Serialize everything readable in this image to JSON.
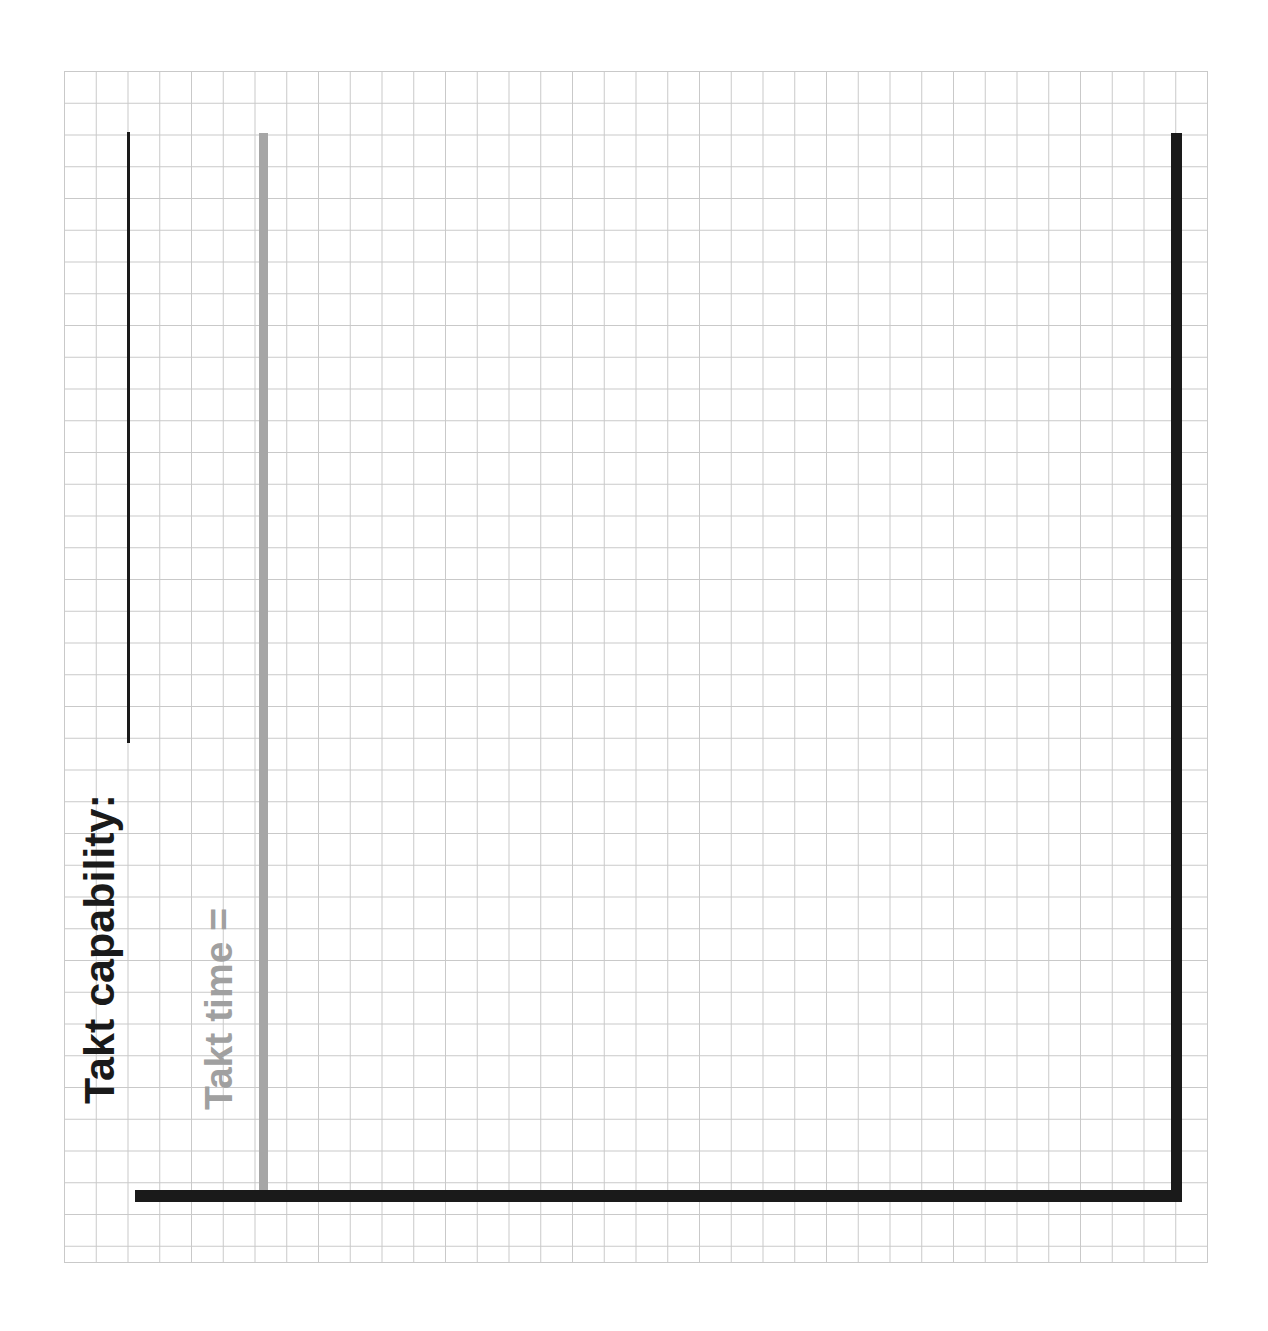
{
  "diagram": {
    "type": "takt-time-vs-capability-sketch",
    "background": "#ffffff",
    "grid": {
      "name": "graph-paper-grid",
      "line_color": "#c9c9c9",
      "cell_size_px": 31.75,
      "visible": true
    },
    "labels": {
      "capability": "Takt capability:",
      "takt_time": "Takt time ="
    },
    "colors": {
      "capability_text": "#1a1a1a",
      "takt_time_text": "#a0a0a0",
      "axis": "#1a1a1a",
      "takt_time_bar": "#a6a6a6",
      "grid_line": "#c9c9c9"
    },
    "marks": [
      {
        "name": "capability-line",
        "color": "#1a1a1a",
        "style": "thin-vertical-rule"
      },
      {
        "name": "takt-time-bar",
        "color": "#a6a6a6",
        "style": "thick-vertical-bar"
      },
      {
        "name": "axis-right",
        "color": "#1a1a1a",
        "style": "heavy-vertical-axis"
      },
      {
        "name": "axis-bottom",
        "color": "#1a1a1a",
        "style": "heavy-horizontal-axis"
      }
    ]
  },
  "chart_data": {
    "type": "bar",
    "title": "",
    "subtitle": "",
    "xlabel": "",
    "ylabel": "",
    "grid": true,
    "legend": "none",
    "annotations": [
      {
        "text": "Takt capability:",
        "color": "#1a1a1a",
        "orientation": "vertical",
        "anchor": "capability-line"
      },
      {
        "text": "Takt time =",
        "color": "#a0a0a0",
        "orientation": "vertical",
        "anchor": "takt-time-bar"
      }
    ],
    "categories": [
      "Takt capability",
      "Takt time",
      "Axis"
    ],
    "series": [
      {
        "name": "vertical marks",
        "values": [
          1.0,
          1.0,
          1.0
        ]
      }
    ],
    "ylim": [
      0,
      1
    ]
  }
}
